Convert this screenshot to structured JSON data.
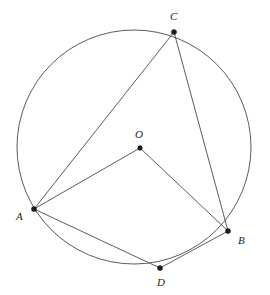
{
  "figure": {
    "background_color": "#ffffff",
    "stroke_color": "#4a4a4a",
    "point_color": "#1c1c1c"
  },
  "chart_data": {
    "type": "diagram",
    "subtype": "euclidean-circle-geometry",
    "viewbox": {
      "width": 270,
      "height": 295
    },
    "circle": {
      "label": "circle",
      "center_label": "O",
      "cx": 134,
      "cy": 147,
      "r": 117
    },
    "points": [
      {
        "name": "C",
        "x": 174,
        "y": 32,
        "label": "C",
        "label_x": 170,
        "label_y": 11,
        "on_circle": true
      },
      {
        "name": "O",
        "x": 140,
        "y": 148,
        "label": "O",
        "label_x": 135,
        "label_y": 129,
        "on_circle": false
      },
      {
        "name": "A",
        "x": 34,
        "y": 209,
        "label": "A",
        "label_x": 16,
        "label_y": 211,
        "on_circle": true
      },
      {
        "name": "B",
        "x": 228,
        "y": 231,
        "label": "B",
        "label_x": 238,
        "label_y": 235,
        "on_circle": true
      },
      {
        "name": "D",
        "x": 160,
        "y": 268,
        "label": "D",
        "label_x": 157,
        "label_y": 277,
        "on_circle": true
      }
    ],
    "segments": [
      {
        "name": "AC",
        "from": "A",
        "to": "C"
      },
      {
        "name": "CB",
        "from": "C",
        "to": "B"
      },
      {
        "name": "AO",
        "from": "A",
        "to": "O"
      },
      {
        "name": "OB",
        "from": "O",
        "to": "B"
      },
      {
        "name": "AD",
        "from": "A",
        "to": "D"
      },
      {
        "name": "DB",
        "from": "D",
        "to": "B"
      }
    ],
    "xlabel": "",
    "ylabel": "",
    "grid": false,
    "legend": "none"
  }
}
